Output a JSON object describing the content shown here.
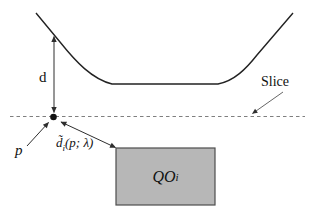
{
  "figure": {
    "labels": {
      "distance": "d",
      "slice": "Slice",
      "point": "p",
      "approx_distance": {
        "base": "d̃",
        "sub": "i",
        "args": "(p; λ)"
      },
      "query_object": {
        "base": "QO",
        "sub": "i"
      }
    },
    "colors": {
      "curve": "#222222",
      "slice_line": "#7f7f7f",
      "arrow": "#2e2e2e",
      "thin_arrow": "#555555",
      "rect_fill": "#b7b7b7",
      "rect_border": "#4d4d4d",
      "dot": "#111111"
    }
  }
}
